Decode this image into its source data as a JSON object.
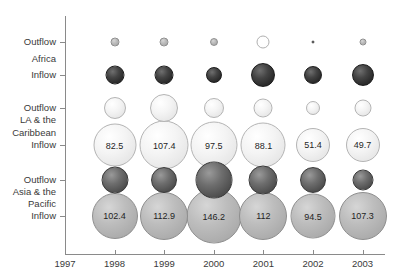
{
  "chart_data": {
    "type": "scatter",
    "title": "",
    "subtitle": "",
    "xlabel": "",
    "ylabel": "",
    "grid": false,
    "legend": "none",
    "x_tick_labels": [
      "1997",
      "1998",
      "1999",
      "2000",
      "2001",
      "2002",
      "2003"
    ],
    "y_tick_labels": [
      "Outflow",
      "Inflow",
      "Outflow",
      "Inflow",
      "Outflow",
      "Inflow"
    ],
    "region_labels": [
      "Africa",
      "LA & the Caribbean",
      "Asia & the Pacific"
    ],
    "regions": [
      {
        "name": "Africa",
        "line1": "Africa",
        "line2": "",
        "outflow_label": "Outflow",
        "inflow_label": "Inflow",
        "outflow": [
          {
            "year": "1998",
            "size": 9,
            "label": ""
          },
          {
            "year": "1999",
            "size": 9,
            "label": ""
          },
          {
            "year": "2000",
            "size": 8,
            "label": ""
          },
          {
            "year": "2001",
            "size": 13,
            "label": ""
          },
          {
            "year": "2002",
            "size": 3,
            "label": ""
          },
          {
            "year": "2003",
            "size": 7,
            "label": ""
          }
        ],
        "inflow": [
          {
            "year": "1998",
            "size": 19,
            "label": ""
          },
          {
            "year": "1999",
            "size": 19,
            "label": ""
          },
          {
            "year": "2000",
            "size": 16,
            "label": ""
          },
          {
            "year": "2001",
            "size": 24,
            "label": ""
          },
          {
            "year": "2002",
            "size": 18,
            "label": ""
          },
          {
            "year": "2003",
            "size": 22,
            "label": ""
          }
        ]
      },
      {
        "name": "LA & the Caribbean",
        "line1": "LA & the",
        "line2": "Caribbean",
        "outflow_label": "Outflow",
        "inflow_label": "Inflow",
        "outflow": [
          {
            "year": "1998",
            "size": 22,
            "label": ""
          },
          {
            "year": "1999",
            "size": 28,
            "label": ""
          },
          {
            "year": "2000",
            "size": 20,
            "label": ""
          },
          {
            "year": "2001",
            "size": 19,
            "label": ""
          },
          {
            "year": "2002",
            "size": 14,
            "label": ""
          },
          {
            "year": "2003",
            "size": 17,
            "label": ""
          }
        ],
        "inflow": [
          {
            "year": "1998",
            "size": 43,
            "label": "82.5"
          },
          {
            "year": "1999",
            "size": 49,
            "label": "107.4"
          },
          {
            "year": "2000",
            "size": 47,
            "label": "97.5"
          },
          {
            "year": "2001",
            "size": 45,
            "label": "88.1"
          },
          {
            "year": "2002",
            "size": 34,
            "label": "51.4"
          },
          {
            "year": "2003",
            "size": 34,
            "label": "49.7"
          }
        ]
      },
      {
        "name": "Asia & the Pacific",
        "line1": "Asia & the",
        "line2": "Pacific",
        "outflow_label": "Outflow",
        "inflow_label": "Inflow",
        "outflow": [
          {
            "year": "1998",
            "size": 27,
            "label": ""
          },
          {
            "year": "1999",
            "size": 26,
            "label": ""
          },
          {
            "year": "2000",
            "size": 37,
            "label": ""
          },
          {
            "year": "2001",
            "size": 29,
            "label": ""
          },
          {
            "year": "2002",
            "size": 26,
            "label": ""
          },
          {
            "year": "2003",
            "size": 21,
            "label": ""
          }
        ],
        "inflow": [
          {
            "year": "1998",
            "size": 46,
            "label": "102.4"
          },
          {
            "year": "1999",
            "size": 48,
            "label": "112.9"
          },
          {
            "year": "2000",
            "size": 55,
            "label": "146.2"
          },
          {
            "year": "2001",
            "size": 48,
            "label": "112"
          },
          {
            "year": "2002",
            "size": 45,
            "label": "94.5"
          },
          {
            "year": "2003",
            "size": 48,
            "label": "107.3"
          }
        ]
      }
    ]
  }
}
